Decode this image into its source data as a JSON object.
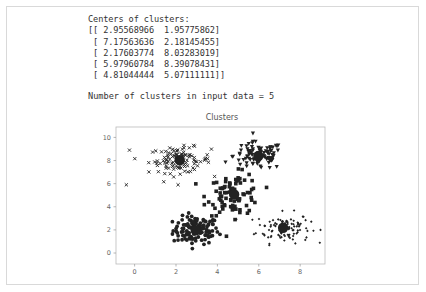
{
  "output": {
    "centers_heading": "Centers of clusters:",
    "centers_rows": [
      "[[ 2.95568966  1.95775862]",
      " [ 7.17563636  2.18145455]",
      " [ 2.17603774  8.03283019]",
      " [ 5.97960784  8.39078431]",
      " [ 4.81044444  5.07111111]]"
    ],
    "cluster_count_line": "Number of clusters in input data = 5"
  },
  "chart_data": {
    "type": "scatter",
    "title": "Clusters",
    "xlabel": "",
    "ylabel": "",
    "xlim": [
      -0.9,
      9.2
    ],
    "ylim": [
      -0.95,
      10.9
    ],
    "xticks": [
      0,
      2,
      4,
      6,
      8
    ],
    "yticks": [
      0,
      2,
      4,
      6,
      8,
      10
    ],
    "grid": false,
    "legend": null,
    "marker_color": "#222222",
    "centers": [
      {
        "x": 2.95568966,
        "y": 1.95775862
      },
      {
        "x": 7.17563636,
        "y": 2.18145455
      },
      {
        "x": 2.17603774,
        "y": 8.03283019
      },
      {
        "x": 5.97960784,
        "y": 8.39078431
      },
      {
        "x": 4.81044444,
        "y": 5.07111111
      }
    ],
    "series": [
      {
        "name": "cluster-0",
        "marker": "o",
        "center": [
          2.96,
          1.96
        ],
        "spread": [
          0.55,
          0.6
        ],
        "count": 116
      },
      {
        "name": "cluster-1",
        "marker": "small-diamond",
        "center": [
          7.18,
          2.18
        ],
        "spread": [
          0.65,
          0.65
        ],
        "count": 110
      },
      {
        "name": "cluster-2",
        "marker": "x",
        "center": [
          2.18,
          8.03
        ],
        "spread": [
          0.75,
          0.55
        ],
        "count": 106
      },
      {
        "name": "cluster-3",
        "marker": "v",
        "center": [
          5.98,
          8.39
        ],
        "spread": [
          0.6,
          0.6
        ],
        "count": 102
      },
      {
        "name": "cluster-4",
        "marker": "s",
        "center": [
          4.81,
          5.07
        ],
        "spread": [
          0.65,
          0.9
        ],
        "count": 90
      }
    ],
    "outliers": [
      {
        "x": -0.4,
        "y": 5.9,
        "marker": "x"
      },
      {
        "x": -0.25,
        "y": 8.9,
        "marker": "x"
      },
      {
        "x": 2.1,
        "y": 5.9,
        "marker": "x"
      }
    ]
  }
}
